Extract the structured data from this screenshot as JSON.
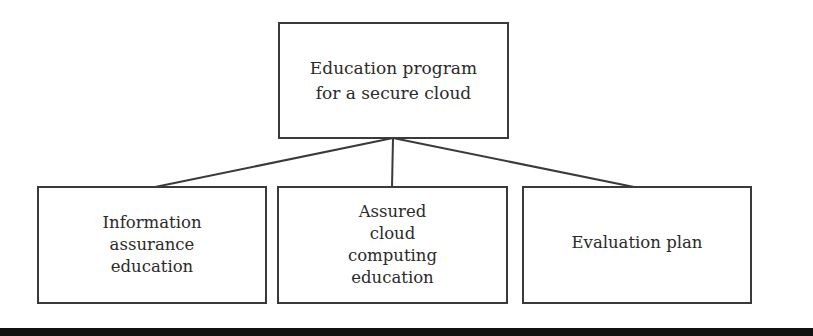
{
  "diagram": {
    "type": "hierarchy-tree",
    "root": {
      "label": "Education program\nfor a secure cloud"
    },
    "children": [
      {
        "label": "Information\nassurance\neducation"
      },
      {
        "label": "Assured\ncloud\ncomputing\neducation"
      },
      {
        "label": "Evaluation plan"
      }
    ],
    "colors": {
      "line": "#3a3a3a",
      "text": "#2a2a2a",
      "background": "#ffffff",
      "bottom_bar": "#111111"
    }
  }
}
